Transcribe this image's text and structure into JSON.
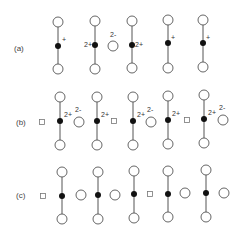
{
  "diagram": {
    "rows": [
      {
        "label": "(a)",
        "label_pos": [
          14,
          51
        ],
        "molecules": [
          {
            "x": 58,
            "top": 22,
            "dot": 46,
            "bottom": 69,
            "charge": "+",
            "charge_pos": [
              62,
              42
            ]
          },
          {
            "x": 95,
            "top": 21,
            "dot": 45,
            "bottom": 69,
            "charge": "2+",
            "charge_pos": [
              84,
              47
            ]
          },
          {
            "x": 132,
            "top": 21,
            "dot": 45,
            "bottom": 68,
            "charge": "2+",
            "charge_pos": [
              135,
              47
            ]
          },
          {
            "x": 168,
            "top": 20,
            "dot": 43,
            "bottom": 68,
            "charge": "+",
            "charge_pos": [
              171,
              40
            ]
          },
          {
            "x": 203,
            "top": 20,
            "dot": 43,
            "bottom": 67,
            "charge": "+",
            "charge_pos": [
              206,
              40
            ]
          }
        ],
        "ions": [
          {
            "type": "circle",
            "x": 113,
            "y": 46,
            "charge": "2-",
            "charge_pos": [
              110,
              37
            ]
          }
        ]
      },
      {
        "label": "(b)",
        "label_pos": [
          16,
          125
        ],
        "molecules": [
          {
            "x": 60,
            "top": 97,
            "dot": 121,
            "bottom": 145,
            "charge": "2+",
            "charge_pos": [
              64,
              117
            ]
          },
          {
            "x": 97,
            "top": 97,
            "dot": 121,
            "bottom": 145,
            "charge": "2+",
            "charge_pos": [
              101,
              117
            ]
          },
          {
            "x": 133,
            "top": 97,
            "dot": 121,
            "bottom": 145,
            "charge": "2+",
            "charge_pos": [
              137,
              117
            ]
          },
          {
            "x": 168,
            "top": 96,
            "dot": 120,
            "bottom": 144,
            "charge": "2+",
            "charge_pos": [
              172,
              116
            ]
          },
          {
            "x": 204,
            "top": 95,
            "dot": 119,
            "bottom": 143,
            "charge": "2+",
            "charge_pos": [
              208,
              115
            ]
          }
        ],
        "ions": [
          {
            "type": "square",
            "x": 42,
            "y": 122
          },
          {
            "type": "circle",
            "x": 79,
            "y": 122,
            "charge": "2-",
            "charge_pos": [
              75,
              112
            ]
          },
          {
            "type": "square",
            "x": 114,
            "y": 121
          },
          {
            "type": "circle",
            "x": 151,
            "y": 122,
            "charge": "2-",
            "charge_pos": [
              147,
              112
            ]
          },
          {
            "type": "square",
            "x": 187,
            "y": 120
          },
          {
            "type": "circle",
            "x": 223,
            "y": 120,
            "charge": "2-",
            "charge_pos": [
              219,
              110
            ]
          }
        ]
      },
      {
        "label": "(c)",
        "label_pos": [
          16,
          198
        ],
        "molecules": [
          {
            "x": 62,
            "top": 172,
            "dot": 196,
            "bottom": 219,
            "charge": "",
            "charge_pos": [
              0,
              0
            ]
          },
          {
            "x": 98,
            "top": 172,
            "dot": 195,
            "bottom": 219,
            "charge": "",
            "charge_pos": [
              0,
              0
            ]
          },
          {
            "x": 134,
            "top": 171,
            "dot": 194,
            "bottom": 218,
            "charge": "",
            "charge_pos": [
              0,
              0
            ]
          },
          {
            "x": 168,
            "top": 171,
            "dot": 194,
            "bottom": 217,
            "charge": "",
            "charge_pos": [
              0,
              0
            ]
          },
          {
            "x": 206,
            "top": 170,
            "dot": 193,
            "bottom": 217,
            "charge": "",
            "charge_pos": [
              0,
              0
            ]
          }
        ],
        "ions": [
          {
            "type": "square",
            "x": 43,
            "y": 196
          },
          {
            "type": "circle",
            "x": 81,
            "y": 195
          },
          {
            "type": "circle",
            "x": 115,
            "y": 195
          },
          {
            "type": "square",
            "x": 150,
            "y": 194
          },
          {
            "type": "circle",
            "x": 185,
            "y": 193
          },
          {
            "type": "circle",
            "x": 224,
            "y": 193
          }
        ]
      }
    ],
    "style": {
      "stroke": "#555555",
      "dot_fill": "#111111",
      "circle_r": 5,
      "dot_r": 3,
      "square_size": 5
    }
  }
}
